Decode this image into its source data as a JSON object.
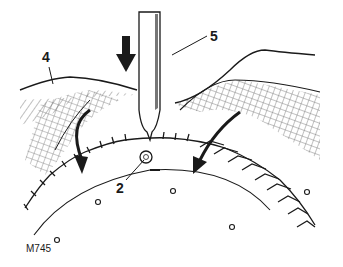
{
  "figure": {
    "id_label": "M745",
    "callouts": [
      {
        "number": "4",
        "target": "housing-edge"
      },
      {
        "number": "5",
        "target": "chisel-tool"
      },
      {
        "number": "2",
        "target": "drilled-hole-in-ring-gear"
      }
    ],
    "colors": {
      "ink": "#1a1a1a",
      "paper": "#ffffff"
    }
  }
}
